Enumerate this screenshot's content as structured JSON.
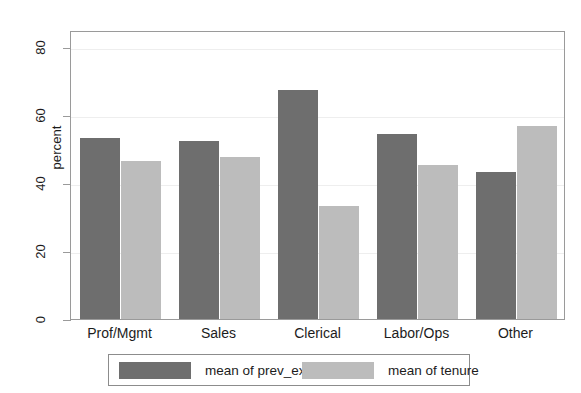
{
  "chart_data": {
    "type": "bar",
    "title": "",
    "xlabel": "",
    "ylabel": "percent",
    "ylim": [
      0,
      85
    ],
    "yticks": [
      0,
      20,
      40,
      60,
      80
    ],
    "ytick_labels": [
      "0",
      "20",
      "40",
      "60",
      "80"
    ],
    "grid": true,
    "legend_position": "bottom",
    "categories": [
      "Prof/Mgmt",
      "Sales",
      "Clerical",
      "Labor/Ops",
      "Other"
    ],
    "series": [
      {
        "name": "mean of prev_exp",
        "color": "#6e6e6e",
        "values": [
          53.2,
          52.3,
          67.5,
          54.5,
          43.3
        ]
      },
      {
        "name": "mean of tenure",
        "color": "#bcbcbc",
        "values": [
          46.5,
          47.6,
          33.3,
          45.4,
          56.8
        ]
      }
    ]
  },
  "axes": {
    "y_title": "percent",
    "frame_color": "#9a9a9a",
    "grid_color": "#eeeeee"
  },
  "legend": {
    "entries": [
      {
        "label": "mean of prev_exp",
        "series": 0
      },
      {
        "label": "mean of tenure",
        "series": 1
      }
    ]
  }
}
